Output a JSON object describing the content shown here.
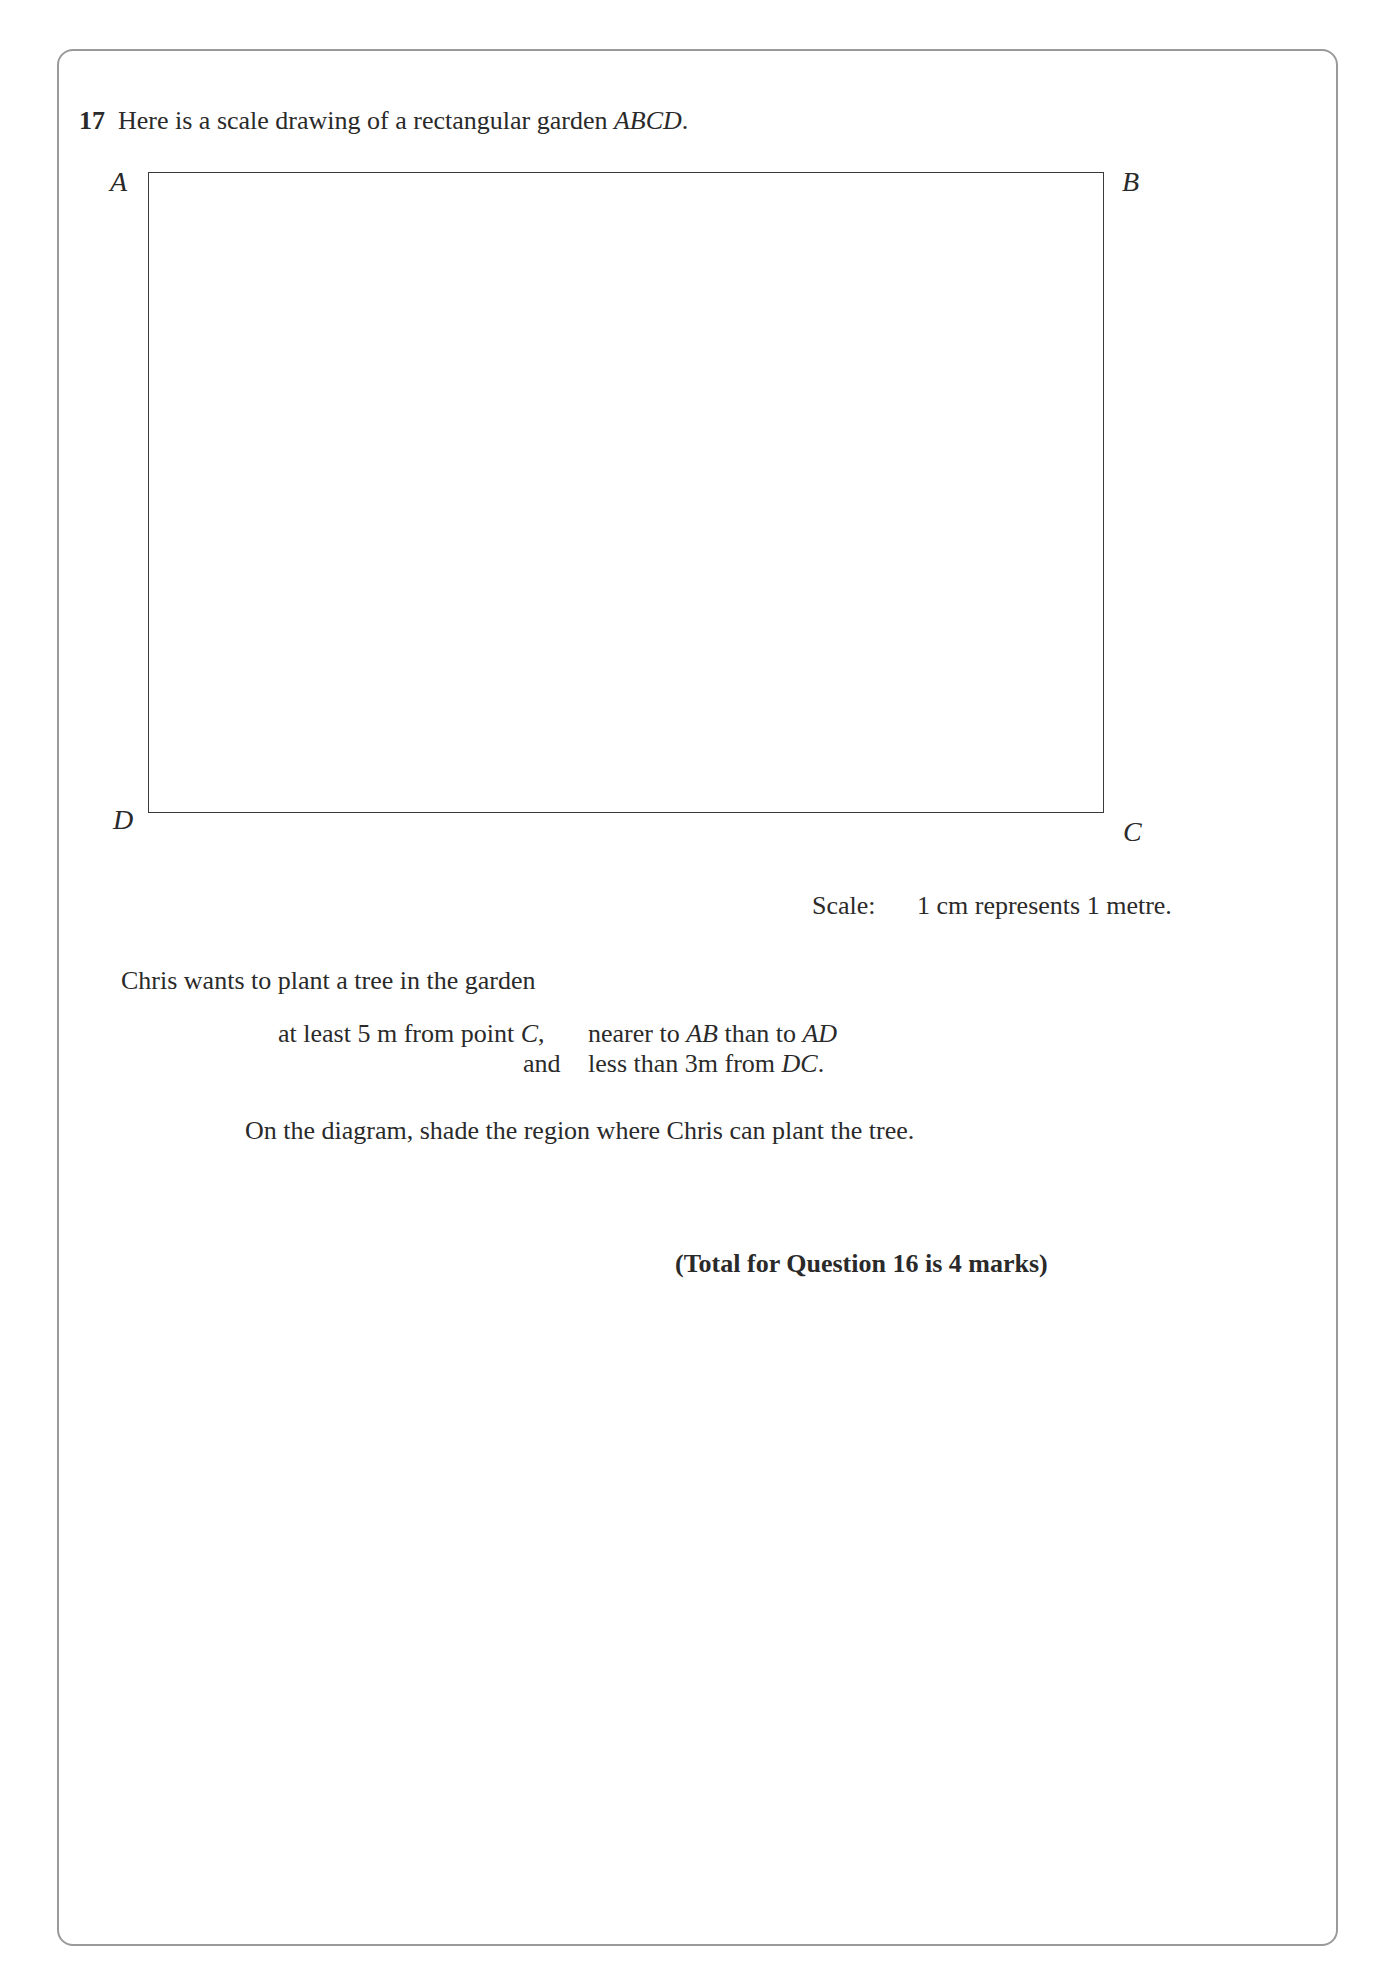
{
  "question": {
    "number": "17",
    "intro": "Here is a scale drawing of a rectangular garden ",
    "intro_shape": "ABCD",
    "intro_end": "."
  },
  "diagram": {
    "vertices": {
      "A": "A",
      "B": "B",
      "C": "C",
      "D": "D"
    },
    "scale_label": "Scale:",
    "scale_value": "1 cm represents 1 metre."
  },
  "conditions": {
    "lead": "Chris wants to plant a tree in the garden",
    "line1_a": "at least 5 m from point ",
    "line1_pointC": "C",
    "line1_comma": ",",
    "line1_b": "nearer to ",
    "line1_AB": "AB",
    "line1_c": " than to ",
    "line1_AD": "AD",
    "line2_and": "and",
    "line2_a": "less than 3m from ",
    "line2_DC": "DC",
    "line2_end": "."
  },
  "instruction": "On the diagram, shade the region where Chris can plant the tree.",
  "total": "(Total for Question 16 is 4 marks)"
}
